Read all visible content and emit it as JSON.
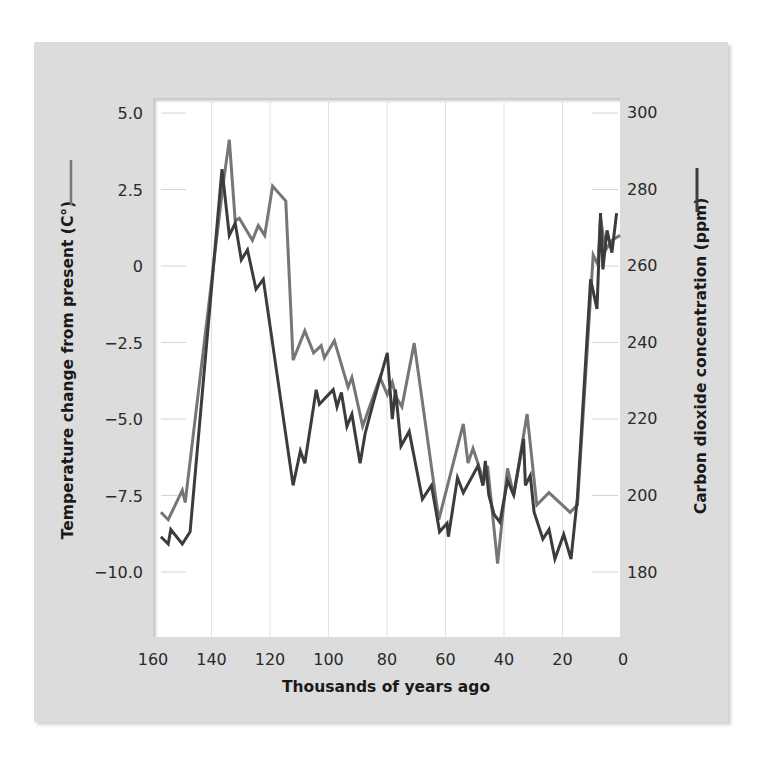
{
  "chart_data": {
    "type": "line",
    "title": "",
    "xlabel": "Thousands of years ago",
    "ylabel": "Temperature change from present (C°)",
    "y2label": "Carbon dioxide concentration (ppm)",
    "xlim": [
      160,
      0
    ],
    "ylim": [
      -12.5,
      5.5
    ],
    "y2lim": [
      167,
      302
    ],
    "x_ticks": [
      160,
      140,
      120,
      100,
      80,
      60,
      40,
      20,
      0
    ],
    "y_ticks": [
      "5.0",
      "2.5",
      "0",
      "−2.5",
      "−5.0",
      "−7.5",
      "−10.0"
    ],
    "y_tick_values": [
      5.0,
      2.5,
      0,
      -2.5,
      -5.0,
      -7.5,
      -10.0
    ],
    "y2_ticks": [
      "300",
      "280",
      "260",
      "240",
      "220",
      "200",
      "180"
    ],
    "y2_tick_values": [
      300,
      280,
      260,
      240,
      220,
      200,
      180
    ],
    "grid": "vertical gridlines at x ticks; short horizontal tick marks at y ticks",
    "legend": "colored bar swatch beside each y-axis title",
    "series": [
      {
        "name": "Temperature change from present (C°)",
        "axis": "left",
        "color": "#767676",
        "points": [
          [
            157.3,
            -8.05
          ],
          [
            154.8,
            -8.29
          ],
          [
            150.0,
            -7.33
          ],
          [
            149.0,
            -7.73
          ],
          [
            136.1,
            2.61
          ],
          [
            133.9,
            4.13
          ],
          [
            131.9,
            1.48
          ],
          [
            130.5,
            1.56
          ],
          [
            126.0,
            0.84
          ],
          [
            124.0,
            1.32
          ],
          [
            121.8,
            1.0
          ],
          [
            119.1,
            2.61
          ],
          [
            114.6,
            2.12
          ],
          [
            112.1,
            -3.08
          ],
          [
            108.1,
            -2.12
          ],
          [
            105.1,
            -2.84
          ],
          [
            102.5,
            -2.6
          ],
          [
            101.4,
            -3.0
          ],
          [
            98.0,
            -2.44
          ],
          [
            93.3,
            -3.96
          ],
          [
            92.0,
            -3.64
          ],
          [
            88.3,
            -5.24
          ],
          [
            82.4,
            -3.64
          ],
          [
            79.9,
            -4.2
          ],
          [
            78.2,
            -3.8
          ],
          [
            76.9,
            -4.28
          ],
          [
            74.9,
            -4.6
          ],
          [
            70.7,
            -2.52
          ],
          [
            62.3,
            -8.29
          ],
          [
            53.9,
            -5.16
          ],
          [
            52.3,
            -6.44
          ],
          [
            50.6,
            -5.96
          ],
          [
            48.1,
            -6.69
          ],
          [
            47.2,
            -7.17
          ],
          [
            45.6,
            -6.53
          ],
          [
            42.2,
            -9.73
          ],
          [
            38.8,
            -6.61
          ],
          [
            36.7,
            -7.49
          ],
          [
            32.1,
            -4.84
          ],
          [
            28.8,
            -7.81
          ],
          [
            24.6,
            -7.41
          ],
          [
            17.4,
            -8.05
          ],
          [
            14.9,
            -7.81
          ],
          [
            9.5,
            0.36
          ],
          [
            7.9,
            0.04
          ],
          [
            7.0,
            1.56
          ],
          [
            5.3,
            0.52
          ],
          [
            3.1,
            0.84
          ],
          [
            0.3,
            1.0
          ]
        ]
      },
      {
        "name": "Carbon dioxide concentration (ppm)",
        "axis": "right",
        "color": "#3c3c3c",
        "points": [
          [
            157.3,
            189.1
          ],
          [
            154.8,
            187.2
          ],
          [
            153.9,
            191.0
          ],
          [
            150.0,
            187.2
          ],
          [
            147.3,
            190.4
          ],
          [
            136.4,
            285.1
          ],
          [
            133.9,
            267.8
          ],
          [
            131.9,
            271.0
          ],
          [
            129.8,
            261.4
          ],
          [
            127.7,
            264.0
          ],
          [
            124.8,
            253.7
          ],
          [
            122.3,
            256.3
          ],
          [
            112.1,
            202.5
          ],
          [
            109.6,
            211.5
          ],
          [
            108.1,
            208.3
          ],
          [
            104.2,
            227.5
          ],
          [
            103.1,
            223.7
          ],
          [
            98.4,
            227.5
          ],
          [
            97.1,
            223.0
          ],
          [
            95.6,
            226.8
          ],
          [
            93.7,
            217.9
          ],
          [
            92.0,
            221.1
          ],
          [
            89.2,
            208.3
          ],
          [
            87.5,
            216.0
          ],
          [
            84.6,
            224.3
          ],
          [
            79.9,
            237.1
          ],
          [
            78.2,
            219.8
          ],
          [
            77.1,
            227.5
          ],
          [
            75.2,
            212.8
          ],
          [
            72.4,
            216.6
          ],
          [
            67.9,
            198.9
          ],
          [
            64.8,
            202.5
          ],
          [
            62.0,
            190.4
          ],
          [
            59.5,
            192.6
          ],
          [
            59.0,
            189.1
          ],
          [
            55.9,
            204.5
          ],
          [
            53.9,
            200.6
          ],
          [
            48.9,
            207.6
          ],
          [
            47.2,
            202.5
          ],
          [
            46.4,
            208.9
          ],
          [
            45.2,
            200.0
          ],
          [
            43.4,
            194.9
          ],
          [
            41.4,
            192.9
          ],
          [
            38.8,
            203.8
          ],
          [
            36.7,
            200.0
          ],
          [
            33.3,
            214.7
          ],
          [
            32.7,
            202.5
          ],
          [
            31.0,
            205.1
          ],
          [
            29.7,
            195.5
          ],
          [
            26.7,
            188.5
          ],
          [
            24.6,
            191.0
          ],
          [
            22.6,
            183.3
          ],
          [
            19.6,
            189.7
          ],
          [
            17.1,
            183.3
          ],
          [
            14.9,
            199.3
          ],
          [
            10.4,
            256.3
          ],
          [
            8.2,
            248.6
          ],
          [
            7.0,
            273.6
          ],
          [
            6.2,
            258.9
          ],
          [
            4.8,
            269.1
          ],
          [
            3.1,
            263.3
          ],
          [
            1.5,
            273.6
          ]
        ]
      }
    ]
  },
  "labels": {
    "x_axis_title": "Thousands of years ago",
    "left_axis_title": "Temperature change from present (C°)",
    "right_axis_title": "Carbon dioxide concentration (ppm)"
  },
  "colors": {
    "card_background": "#dcdcdc",
    "plot_background": "#ffffff",
    "temperature_line": "#767676",
    "co2_line": "#3c3c3c",
    "gridline": "#e2e2e2"
  }
}
